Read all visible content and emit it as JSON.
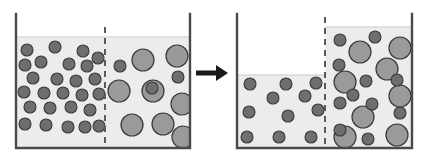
{
  "figure": {
    "type": "two-panel-beaker-diagram",
    "background_color": "#ffffff",
    "arrow": {
      "name": "process-arrow",
      "direction": "right",
      "color": "#1a1a1a",
      "x1": 196,
      "x2": 228,
      "y": 73,
      "shaft_thickness": 5,
      "head_length": 12,
      "head_half_height": 8
    },
    "solute_large": {
      "label": "large solute particle",
      "fill": "#9a9a9a",
      "stroke": "#3a3a3a",
      "stroke_width": 1.2,
      "radius": 11
    },
    "solute_small": {
      "label": "small water/solvent particle",
      "fill": "#6e6e6e",
      "stroke": "#3a3a3a",
      "stroke_width": 1.1,
      "radius": 6
    },
    "beaker_style": {
      "wall_color": "#4a4a4a",
      "wall_width": 2.4,
      "fluid_color": "#ececec",
      "fluid_edge_color": "#d8d8d8",
      "membrane_color": "#5a5a5a",
      "membrane_width": 2,
      "membrane_dash": "6 5"
    },
    "panels": [
      {
        "name": "before-panel",
        "caption": "",
        "beaker": {
          "left": 16,
          "right": 190,
          "top": 14,
          "bottom": 148
        },
        "membrane_x": 105,
        "fluid_left_top": 37,
        "fluid_right_top": 37,
        "left_compartment": {
          "name": "left-compartment",
          "small_particles": [
            [
              27,
              50
            ],
            [
              55,
              47
            ],
            [
              83,
              51
            ],
            [
              98,
              58
            ],
            [
              25,
              65
            ],
            [
              41,
              62
            ],
            [
              69,
              64
            ],
            [
              87,
              66
            ],
            [
              33,
              78
            ],
            [
              57,
              79
            ],
            [
              76,
              81
            ],
            [
              95,
              79
            ],
            [
              24,
              92
            ],
            [
              44,
              93
            ],
            [
              63,
              93
            ],
            [
              82,
              95
            ],
            [
              99,
              94
            ],
            [
              30,
              107
            ],
            [
              50,
              108
            ],
            [
              71,
              107
            ],
            [
              90,
              110
            ],
            [
              25,
              124
            ],
            [
              46,
              125
            ],
            [
              68,
              127
            ],
            [
              85,
              127
            ],
            [
              99,
              126
            ]
          ],
          "large_particles": []
        },
        "right_compartment": {
          "name": "right-compartment",
          "small_particles": [
            [
              120,
              66
            ],
            [
              152,
              88
            ],
            [
              178,
              77
            ]
          ],
          "large_particles": [
            [
              143,
              60
            ],
            [
              177,
              56
            ],
            [
              119,
              91
            ],
            [
              153,
              91
            ],
            [
              132,
              125
            ],
            [
              163,
              124
            ],
            [
              182,
              104
            ],
            [
              183,
              137
            ]
          ]
        }
      },
      {
        "name": "after-panel",
        "caption": "",
        "beaker": {
          "left": 237,
          "right": 412,
          "top": 14,
          "bottom": 148
        },
        "membrane_x": 325,
        "fluid_left_top": 75,
        "fluid_right_top": 27,
        "left_compartment": {
          "name": "left-compartment",
          "small_particles": [
            [
              250,
              84
            ],
            [
              286,
              84
            ],
            [
              316,
              83
            ],
            [
              273,
              98
            ],
            [
              305,
              96
            ],
            [
              249,
              112
            ],
            [
              288,
              116
            ],
            [
              318,
              110
            ],
            [
              247,
              137
            ],
            [
              279,
              137
            ],
            [
              311,
              137
            ]
          ],
          "large_particles": []
        },
        "right_compartment": {
          "name": "right-compartment",
          "small_particles": [
            [
              340,
              40
            ],
            [
              375,
              37
            ],
            [
              339,
              65
            ],
            [
              366,
              81
            ],
            [
              353,
              95
            ],
            [
              397,
              80
            ],
            [
              340,
              103
            ],
            [
              372,
              104
            ],
            [
              400,
              113
            ],
            [
              340,
              130
            ],
            [
              368,
              139
            ]
          ],
          "large_particles": [
            [
              360,
              52
            ],
            [
              400,
              48
            ],
            [
              387,
              69
            ],
            [
              345,
              82
            ],
            [
              400,
              96
            ],
            [
              363,
              117
            ],
            [
              345,
              137
            ],
            [
              397,
              135
            ]
          ]
        }
      }
    ]
  }
}
